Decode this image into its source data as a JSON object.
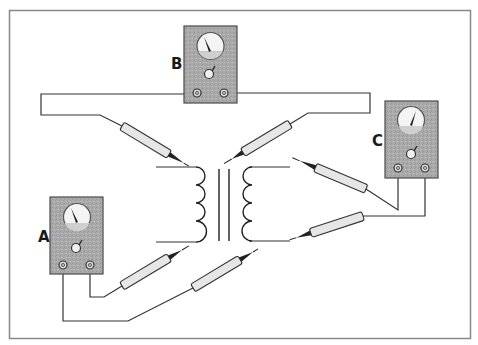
{
  "diagram": {
    "meters": [
      {
        "id": "A",
        "label": "A",
        "x": 50,
        "y": 197,
        "w": 53,
        "h": 77,
        "needle_angle": -28
      },
      {
        "id": "B",
        "label": "B",
        "x": 184,
        "y": 26,
        "w": 53,
        "h": 77,
        "needle_angle": -28
      },
      {
        "id": "C",
        "label": "C",
        "x": 385,
        "y": 101,
        "w": 53,
        "h": 77,
        "needle_angle": 28
      }
    ],
    "colors": {
      "meter_body": "#a9a9a9",
      "meter_border": "#4a4a4a",
      "dial_face": "#f4f4f4",
      "probe_fill": "#e6e6e6",
      "wire": "#333333",
      "frame": "#888888"
    }
  }
}
